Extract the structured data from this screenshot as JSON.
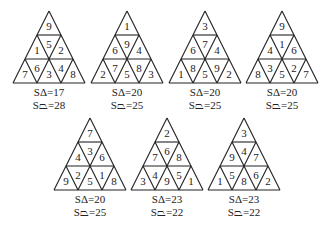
{
  "figure": {
    "puzzles": [
      {
        "cells": [
          "9",
          "1",
          "5",
          "2",
          "7",
          "6",
          "3",
          "4",
          "8"
        ],
        "sum_triangle_label": "SΔ=17",
        "sum_trapezoid_label": "S⏢=28"
      },
      {
        "cells": [
          "1",
          "6",
          "9",
          "4",
          "2",
          "7",
          "5",
          "8",
          "3"
        ],
        "sum_triangle_label": "SΔ=20",
        "sum_trapezoid_label": "S⏢=25"
      },
      {
        "cells": [
          "3",
          "6",
          "7",
          "4",
          "1",
          "8",
          "5",
          "9",
          "2"
        ],
        "sum_triangle_label": "SΔ=20",
        "sum_trapezoid_label": "S⏢=25"
      },
      {
        "cells": [
          "9",
          "4",
          "1",
          "6",
          "8",
          "3",
          "5",
          "2",
          "7"
        ],
        "sum_triangle_label": "SΔ=20",
        "sum_trapezoid_label": "S⏢=25"
      },
      {
        "cells": [
          "7",
          "4",
          "3",
          "6",
          "9",
          "2",
          "5",
          "1",
          "8"
        ],
        "sum_triangle_label": "SΔ=20",
        "sum_trapezoid_label": "S⏢=25"
      },
      {
        "cells": [
          "2",
          "7",
          "6",
          "8",
          "3",
          "4",
          "9",
          "5",
          "1"
        ],
        "sum_triangle_label": "SΔ=23",
        "sum_trapezoid_label": "S⏢=22"
      },
      {
        "cells": [
          "3",
          "9",
          "4",
          "7",
          "1",
          "5",
          "8",
          "6",
          "2"
        ],
        "sum_triangle_label": "SΔ=23",
        "sum_trapezoid_label": "S⏢=22"
      }
    ],
    "line_color": "#222222"
  }
}
